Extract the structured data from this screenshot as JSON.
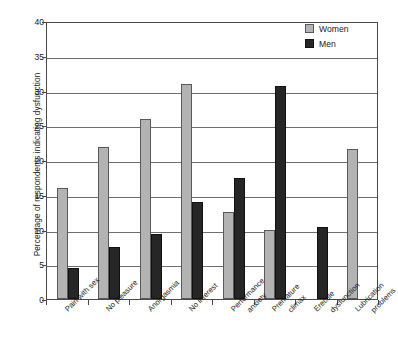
{
  "chart_data": {
    "type": "bar",
    "title": "",
    "xlabel": "",
    "ylabel": "Percentage of respondents indicating dysfunction",
    "ylim": [
      0,
      40
    ],
    "yticks": [
      0,
      5,
      10,
      15,
      20,
      25,
      30,
      35,
      40
    ],
    "grid": true,
    "legend_position": "top-right",
    "categories": [
      "Pain with sex",
      "No pleasure",
      "Anorgasmia",
      "No interest",
      "Performance anxiety",
      "Premature climax",
      "Erectile dysfunction",
      "Lubrication problems"
    ],
    "category_lines": [
      [
        "Pain with sex"
      ],
      [
        "No pleasure"
      ],
      [
        "Anorgasmia"
      ],
      [
        "No interest"
      ],
      [
        "Performance",
        "anxiety"
      ],
      [
        "Premature",
        "climax"
      ],
      [
        "Erectile",
        "dysfunction"
      ],
      [
        "Lubrication",
        "problems"
      ]
    ],
    "series": [
      {
        "name": "Women",
        "color": "#b3b3b3",
        "values": [
          16.0,
          21.9,
          25.9,
          30.9,
          12.5,
          10.0,
          null,
          21.6
        ]
      },
      {
        "name": "Men",
        "color": "#262626",
        "values": [
          4.5,
          7.5,
          9.3,
          14.0,
          17.4,
          30.7,
          10.4,
          null
        ]
      }
    ]
  },
  "legend": {
    "items": [
      {
        "label": "Women",
        "swatch": "women-swatch"
      },
      {
        "label": "Men",
        "swatch": "men-swatch"
      }
    ]
  },
  "axes": {
    "y_title": "Percentage of respondents indicating dysfunction",
    "y_tick_labels": [
      "0",
      "5",
      "10",
      "15",
      "20",
      "25",
      "30",
      "35",
      "40"
    ]
  }
}
